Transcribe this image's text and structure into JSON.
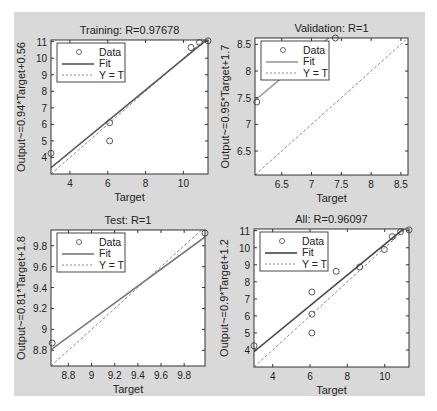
{
  "chart_data": [
    {
      "type": "scatter",
      "id": "training",
      "title": "Training: R=0.97678",
      "xlabel": "Target",
      "ylabel": "Output~=0.94*Target+0.56",
      "xlim": [
        3,
        11.3
      ],
      "ylim": [
        3,
        11.1
      ],
      "xticks": [
        4,
        6,
        8,
        10
      ],
      "yticks": [
        4,
        5,
        6,
        7,
        8,
        9,
        10,
        11
      ],
      "fit": {
        "slope": 0.94,
        "intercept": 0.56,
        "color": "#555555"
      },
      "points": [
        [
          3.0,
          4.25
        ],
        [
          6.1,
          6.1
        ],
        [
          6.1,
          5.0
        ],
        [
          10.4,
          10.65
        ],
        [
          10.85,
          10.95
        ],
        [
          11.3,
          11.05
        ]
      ],
      "legend": [
        "Data",
        "Fit",
        "Y = T"
      ],
      "grid": false
    },
    {
      "type": "scatter",
      "id": "validation",
      "title": "Validation: R=1",
      "xlabel": "Target",
      "ylabel": "Output~=0.95*Target+1.7",
      "xlim": [
        6.05,
        8.62
      ],
      "ylim": [
        6.05,
        8.62
      ],
      "xticks": [
        6.5,
        7,
        7.5,
        8,
        8.5
      ],
      "yticks": [
        6.5,
        7,
        7.5,
        8,
        8.5
      ],
      "fit": {
        "slope": 0.95,
        "intercept": 1.7,
        "color": "#999999"
      },
      "points": [
        [
          6.08,
          7.42
        ],
        [
          7.4,
          8.62
        ]
      ],
      "legend": [
        "Data",
        "Fit",
        "Y = T"
      ],
      "grid": false
    },
    {
      "type": "scatter",
      "id": "test",
      "title": "Test: R=1",
      "xlabel": "Target",
      "ylabel": "Output~=0.81*Target+1.8",
      "xlim": [
        8.65,
        9.98
      ],
      "ylim": [
        8.65,
        9.95
      ],
      "xticks": [
        8.8,
        9,
        9.2,
        9.4,
        9.6,
        9.8
      ],
      "yticks": [
        8.8,
        9,
        9.2,
        9.4,
        9.6,
        9.8
      ],
      "fit": {
        "slope": 0.81,
        "intercept": 1.8,
        "color": "#777777"
      },
      "points": [
        [
          8.66,
          8.87
        ],
        [
          9.98,
          9.92
        ]
      ],
      "legend": [
        "Data",
        "Fit",
        "Y = T"
      ],
      "grid": false
    },
    {
      "type": "scatter",
      "id": "all",
      "title": "All: R=0.96097",
      "xlabel": "Target",
      "ylabel": "Output~=0.9*Target+1.2",
      "xlim": [
        3,
        11.3
      ],
      "ylim": [
        3,
        11.1
      ],
      "xticks": [
        4,
        6,
        8,
        10
      ],
      "yticks": [
        4,
        5,
        6,
        7,
        8,
        9,
        10,
        11
      ],
      "fit": {
        "slope": 0.9,
        "intercept": 1.2,
        "color": "#444444"
      },
      "points": [
        [
          3.0,
          4.25
        ],
        [
          6.1,
          7.4
        ],
        [
          6.1,
          6.1
        ],
        [
          6.1,
          5.0
        ],
        [
          7.4,
          8.62
        ],
        [
          8.66,
          8.87
        ],
        [
          9.98,
          9.9
        ],
        [
          10.4,
          10.65
        ],
        [
          10.85,
          10.95
        ],
        [
          11.3,
          11.05
        ]
      ],
      "legend": [
        "Data",
        "Fit",
        "Y = T"
      ],
      "grid": false
    }
  ],
  "layout": {
    "boxes": [
      {
        "x": 51,
        "y": 40,
        "w": 157,
        "h": 134
      },
      {
        "x": 255,
        "y": 38,
        "w": 153,
        "h": 137
      },
      {
        "x": 51,
        "y": 230,
        "w": 154,
        "h": 136
      },
      {
        "x": 254,
        "y": 229,
        "w": 155,
        "h": 138
      }
    ]
  }
}
